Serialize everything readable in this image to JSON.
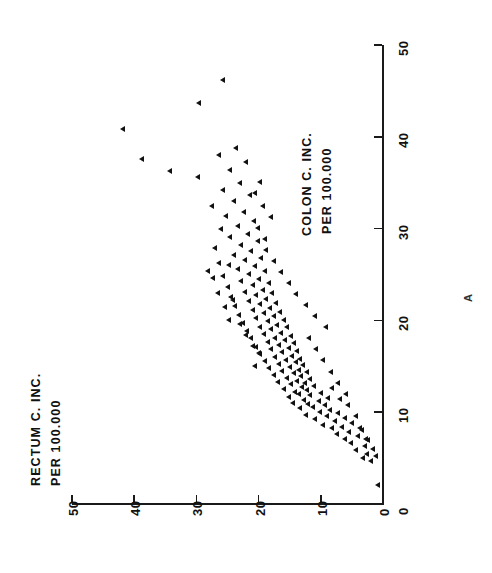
{
  "figure": {
    "annotation": "A",
    "marker_color": "#111111",
    "axis_color": "#1a1a1a",
    "background": "#ffffff",
    "rotation_note": "90"
  },
  "axes": {
    "x": {
      "label_line1": "COLON C. INC.",
      "label_line2": "PER 100.000",
      "ticks": [
        "0",
        "10",
        "20",
        "30",
        "40",
        "50"
      ],
      "min": 0,
      "max": 50
    },
    "y": {
      "label_line1": "RECTUM C. INC.",
      "label_line2": "PER 100.000",
      "ticks": [
        "0",
        "10",
        "20",
        "30",
        "40",
        "50"
      ],
      "min": 0,
      "max": 50
    }
  },
  "chart_data": {
    "type": "scatter",
    "title": "",
    "xlabel": "COLON C. INC. PER 100.000",
    "ylabel": "RECTUM C. INC. PER 100.000",
    "xlim": [
      0,
      50
    ],
    "ylim": [
      0,
      50
    ],
    "xticks": [
      0,
      10,
      20,
      30,
      40,
      50
    ],
    "yticks": [
      0,
      10,
      20,
      30,
      40,
      50
    ],
    "grid": false,
    "legend": null,
    "marker": "left-triangle",
    "annotations": [
      {
        "text": "A",
        "x": 46.5,
        "y": -3.5
      }
    ],
    "points": [
      [
        2.0,
        0.9
      ],
      [
        4.6,
        1.9
      ],
      [
        5.0,
        3.3
      ],
      [
        5.4,
        2.6
      ],
      [
        5.9,
        4.3
      ],
      [
        6.3,
        3.0
      ],
      [
        6.6,
        5.2
      ],
      [
        6.9,
        2.4
      ],
      [
        7.1,
        6.1
      ],
      [
        7.4,
        4.0
      ],
      [
        7.6,
        7.4
      ],
      [
        7.8,
        5.5
      ],
      [
        8.0,
        3.4
      ],
      [
        8.2,
        8.3
      ],
      [
        8.4,
        6.6
      ],
      [
        8.6,
        9.6
      ],
      [
        8.8,
        5.0
      ],
      [
        9.0,
        7.8
      ],
      [
        9.2,
        11.0
      ],
      [
        9.3,
        6.2
      ],
      [
        9.5,
        9.1
      ],
      [
        9.7,
        12.4
      ],
      [
        9.9,
        7.3
      ],
      [
        10.0,
        10.2
      ],
      [
        10.2,
        8.5
      ],
      [
        10.4,
        13.4
      ],
      [
        10.5,
        11.3
      ],
      [
        10.7,
        9.4
      ],
      [
        10.9,
        12.1
      ],
      [
        11.0,
        14.5
      ],
      [
        11.2,
        10.4
      ],
      [
        11.3,
        12.8
      ],
      [
        11.5,
        8.9
      ],
      [
        11.6,
        15.2
      ],
      [
        11.8,
        11.7
      ],
      [
        11.9,
        13.6
      ],
      [
        12.1,
        10.0
      ],
      [
        12.2,
        14.1
      ],
      [
        12.4,
        12.3
      ],
      [
        12.5,
        16.0
      ],
      [
        12.7,
        13.0
      ],
      [
        12.8,
        11.2
      ],
      [
        13.0,
        14.8
      ],
      [
        13.1,
        12.6
      ],
      [
        13.3,
        16.9
      ],
      [
        13.4,
        13.9
      ],
      [
        13.6,
        11.8
      ],
      [
        13.7,
        15.4
      ],
      [
        13.9,
        13.2
      ],
      [
        14.0,
        17.6
      ],
      [
        14.2,
        14.4
      ],
      [
        14.3,
        12.2
      ],
      [
        14.5,
        16.2
      ],
      [
        14.6,
        13.6
      ],
      [
        14.8,
        18.4
      ],
      [
        14.9,
        15.0
      ],
      [
        15.1,
        12.9
      ],
      [
        15.2,
        16.8
      ],
      [
        15.4,
        14.0
      ],
      [
        15.5,
        19.0
      ],
      [
        15.7,
        15.6
      ],
      [
        15.8,
        13.4
      ],
      [
        16.0,
        17.4
      ],
      [
        16.1,
        14.6
      ],
      [
        16.3,
        19.8
      ],
      [
        16.5,
        16.2
      ],
      [
        16.6,
        13.9
      ],
      [
        16.8,
        18.0
      ],
      [
        17.0,
        15.2
      ],
      [
        17.1,
        20.5
      ],
      [
        17.3,
        16.8
      ],
      [
        17.5,
        14.3
      ],
      [
        17.6,
        18.6
      ],
      [
        17.8,
        15.8
      ],
      [
        18.0,
        21.2
      ],
      [
        18.1,
        17.4
      ],
      [
        18.3,
        14.8
      ],
      [
        18.5,
        19.2
      ],
      [
        18.6,
        16.4
      ],
      [
        18.8,
        21.9
      ],
      [
        19.0,
        18.0
      ],
      [
        19.2,
        15.4
      ],
      [
        19.3,
        19.8
      ],
      [
        19.5,
        17.0
      ],
      [
        19.7,
        22.6
      ],
      [
        19.9,
        18.6
      ],
      [
        20.0,
        16.0
      ],
      [
        20.2,
        20.4
      ],
      [
        20.4,
        17.6
      ],
      [
        20.6,
        23.2
      ],
      [
        20.8,
        19.2
      ],
      [
        20.9,
        16.6
      ],
      [
        21.1,
        21.0
      ],
      [
        21.3,
        18.2
      ],
      [
        21.5,
        23.8
      ],
      [
        21.7,
        19.8
      ],
      [
        21.9,
        17.2
      ],
      [
        22.1,
        21.6
      ],
      [
        22.3,
        18.8
      ],
      [
        22.5,
        24.4
      ],
      [
        22.7,
        20.4
      ],
      [
        22.9,
        17.8
      ],
      [
        23.1,
        22.2
      ],
      [
        23.3,
        19.4
      ],
      [
        23.6,
        25.0
      ],
      [
        23.8,
        21.0
      ],
      [
        24.0,
        18.4
      ],
      [
        24.3,
        22.8
      ],
      [
        24.5,
        20.0
      ],
      [
        24.8,
        25.8
      ],
      [
        25.0,
        21.6
      ],
      [
        25.3,
        19.0
      ],
      [
        25.6,
        23.4
      ],
      [
        25.9,
        20.6
      ],
      [
        26.2,
        26.4
      ],
      [
        26.5,
        22.2
      ],
      [
        26.8,
        19.6
      ],
      [
        27.1,
        24.0
      ],
      [
        27.5,
        21.2
      ],
      [
        27.8,
        27.0
      ],
      [
        28.2,
        22.8
      ],
      [
        28.6,
        20.2
      ],
      [
        29.0,
        24.6
      ],
      [
        29.4,
        21.8
      ],
      [
        29.9,
        26.0
      ],
      [
        30.3,
        23.4
      ],
      [
        30.8,
        20.8
      ],
      [
        31.3,
        25.2
      ],
      [
        31.8,
        22.4
      ],
      [
        32.4,
        27.6
      ],
      [
        33.0,
        24.0
      ],
      [
        33.6,
        21.4
      ],
      [
        34.2,
        25.8
      ],
      [
        34.9,
        23.0
      ],
      [
        35.6,
        29.8
      ],
      [
        36.4,
        24.6
      ],
      [
        37.2,
        22.0
      ],
      [
        38.0,
        26.4
      ],
      [
        38.8,
        23.6
      ],
      [
        37.6,
        38.8
      ],
      [
        36.2,
        34.2
      ],
      [
        40.8,
        41.8
      ],
      [
        43.6,
        29.6
      ],
      [
        46.2,
        25.8
      ],
      [
        12.0,
        6.0
      ],
      [
        13.2,
        7.2
      ],
      [
        14.4,
        8.4
      ],
      [
        15.6,
        9.6
      ],
      [
        16.8,
        10.8
      ],
      [
        18.0,
        12.0
      ],
      [
        19.2,
        9.2
      ],
      [
        20.4,
        11.0
      ],
      [
        21.6,
        12.4
      ],
      [
        22.8,
        14.0
      ],
      [
        24.0,
        15.2
      ],
      [
        25.2,
        16.4
      ],
      [
        26.4,
        17.6
      ],
      [
        27.6,
        18.8
      ],
      [
        28.8,
        19.0
      ],
      [
        30.0,
        20.2
      ],
      [
        31.2,
        18.0
      ],
      [
        32.4,
        19.4
      ],
      [
        33.8,
        20.6
      ],
      [
        35.0,
        19.8
      ],
      [
        9.6,
        4.4
      ],
      [
        10.8,
        5.6
      ],
      [
        8.2,
        3.8
      ],
      [
        7.0,
        2.8
      ],
      [
        11.4,
        7.0
      ],
      [
        12.6,
        8.2
      ],
      [
        6.0,
        1.6
      ],
      [
        5.2,
        1.2
      ],
      [
        23.0,
        26.6
      ],
      [
        24.6,
        27.4
      ],
      [
        21.4,
        25.4
      ],
      [
        22.2,
        24.2
      ],
      [
        19.6,
        23.0
      ],
      [
        18.4,
        22.0
      ],
      [
        17.2,
        21.0
      ],
      [
        16.4,
        20.0
      ],
      [
        25.4,
        28.2
      ],
      [
        26.0,
        24.8
      ],
      [
        20.0,
        24.8
      ],
      [
        15.0,
        20.6
      ]
    ]
  }
}
